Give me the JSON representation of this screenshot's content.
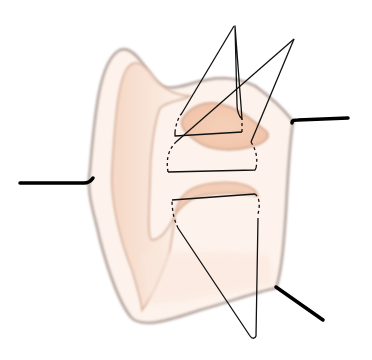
{
  "diagram": {
    "title": "",
    "colors": {
      "background": "#ffffff",
      "outer_outline": "#b8a9a3",
      "body_fill": "#fcf1ea",
      "shading": "#f2c9b0",
      "inner_outline": "#d9b4a0",
      "wire": "#111111",
      "lead": "#000000"
    },
    "leads": [
      {
        "name": "left-lead",
        "from": [
          20,
          183
        ],
        "to": [
          92,
          181
        ]
      },
      {
        "name": "upper-right-lead",
        "from": [
          292,
          121
        ],
        "to": [
          348,
          118
        ]
      },
      {
        "name": "lower-right-lead",
        "from": [
          276,
          287
        ],
        "to": [
          323,
          320
        ]
      }
    ],
    "loops": [
      {
        "name": "upper-left-triangle-loop",
        "apex": [
          234,
          26
        ]
      },
      {
        "name": "upper-right-triangle-loop",
        "apex": [
          294,
          39
        ]
      },
      {
        "name": "lower-triangle-loop",
        "apex": [
          255,
          338
        ]
      }
    ]
  }
}
